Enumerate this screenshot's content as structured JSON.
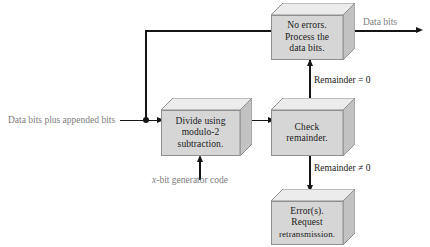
{
  "diagram": {
    "colors": {
      "box_face": "#d6d6d6",
      "box_top": "#ececec",
      "box_side": "#c2c2c2",
      "box_border": "#8f8f8f",
      "connector": "#151515",
      "note_text": "#7d7d7d",
      "label_text": "#1a1a1a",
      "background": "#ffffff"
    },
    "boxes": [
      {
        "id": "no-errors",
        "lines": [
          "No errors.",
          "Process the",
          "data bits."
        ],
        "text": "No errors. Process the data bits."
      },
      {
        "id": "divide",
        "lines": [
          "Divide using",
          "modulo-2",
          "subtraction."
        ],
        "text": "Divide using modulo-2 subtraction."
      },
      {
        "id": "check-remainder",
        "lines": [
          "Check",
          "remainder."
        ],
        "text": "Check remainder."
      },
      {
        "id": "errors",
        "lines": [
          "Error(s).",
          "Request",
          "retransmission."
        ],
        "text": "Error(s). Request retransmission."
      }
    ],
    "labels": {
      "input": "Data bits plus appended bits",
      "generator": "x-bit generator code",
      "generator_italic_prefix": "x",
      "generator_rest": "-bit generator code",
      "output": "Data bits",
      "remainder_zero": "Remainder = 0",
      "remainder_nonzero": "Remainder ≠ 0"
    }
  }
}
